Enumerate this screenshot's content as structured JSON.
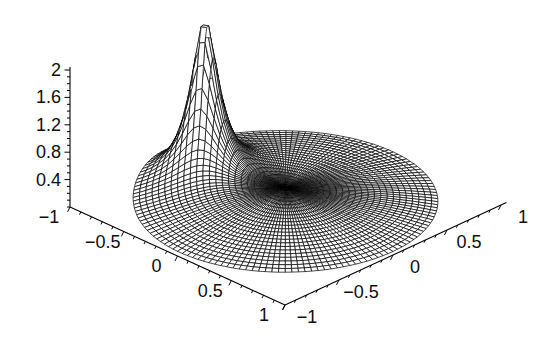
{
  "page": {
    "background": "#ffffff"
  },
  "chart_data": {
    "type": "surface3d-wireframe",
    "title": "",
    "line_color": "#000000",
    "background": "#ffffff",
    "mesh": {
      "rings": 24,
      "spokes": 144,
      "radius": 1
    },
    "surface": {
      "base_offset": 0.04,
      "base_amplitude": 0.14,
      "spike_x": -0.58,
      "spike_y": 0.169,
      "spike_amplitude": 0.03,
      "spike_epsilon": 0.013,
      "z_clip": 2.4
    },
    "axes": {
      "x": {
        "min": -1,
        "max": 1,
        "minor_step": 0.1,
        "major_ticks": [
          -1,
          -0.5,
          0,
          0.5,
          1
        ],
        "labels": [
          "−1",
          "−0.5",
          "0",
          "0.5",
          "1"
        ]
      },
      "y": {
        "min": -1,
        "max": 1,
        "minor_step": 0.1,
        "major_ticks": [
          -1,
          -0.5,
          0,
          0.5,
          1
        ],
        "labels": [
          "−1",
          "−0.5",
          "0",
          "0.5",
          "1"
        ]
      },
      "z": {
        "min": 0,
        "max": 2,
        "minor_step": 0.1,
        "major_ticks": [
          0.4,
          0.8,
          1.2,
          1.6,
          2
        ],
        "labels": [
          "0.4",
          "0.8",
          "1.2",
          "1.6",
          "2"
        ]
      }
    },
    "view": {
      "origin": [
        285.5,
        206
      ],
      "ex": [
        107.5,
        49
      ],
      "ey": [
        -108,
        50
      ],
      "ez_y": -68.5
    }
  }
}
